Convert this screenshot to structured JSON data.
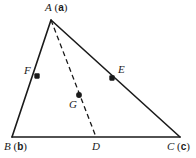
{
  "figure": {
    "kind": "geometry-diagram",
    "width": 196,
    "height": 158,
    "background_color": "#ffffff",
    "stroke_color": "#1a1a1a",
    "marker_color": "#1a1a1a"
  },
  "vertices": {
    "A": {
      "x": 51,
      "y": 20
    },
    "B": {
      "x": 12,
      "y": 137
    },
    "C": {
      "x": 180,
      "y": 137
    }
  },
  "points": {
    "D": {
      "x": 96,
      "y": 137
    },
    "E": {
      "x": 112,
      "y": 78
    },
    "F": {
      "x": 37,
      "y": 76
    },
    "G": {
      "x": 79,
      "y": 95
    }
  },
  "labels": {
    "A": {
      "italic": "A",
      "paren_open": " (",
      "bold": "a",
      "paren_close": ")"
    },
    "B": {
      "italic": "B",
      "paren_open": " (",
      "bold": "b",
      "paren_close": ")"
    },
    "C": {
      "italic": "C",
      "paren_open": " (",
      "bold": "c",
      "paren_close": ")"
    },
    "D": {
      "italic": "D"
    },
    "E": {
      "italic": "E"
    },
    "F": {
      "italic": "F"
    },
    "G": {
      "italic": "G"
    }
  },
  "segments": [
    {
      "name": "side-AB",
      "from": "A",
      "to": "B",
      "style": "solid"
    },
    {
      "name": "side-AC",
      "from": "A",
      "to": "C",
      "style": "solid"
    },
    {
      "name": "side-BC",
      "from": "B",
      "to": "C",
      "style": "solid"
    },
    {
      "name": "cevian-AD",
      "from": "A",
      "to": "D",
      "style": "dashed"
    }
  ]
}
